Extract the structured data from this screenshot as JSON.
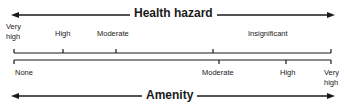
{
  "top_scale": {
    "title": "Health hazard",
    "labels": [
      {
        "line1": "Very",
        "line2": "high"
      },
      {
        "text": "High"
      },
      {
        "text": "Moderate"
      },
      {
        "text": "Insignificant"
      }
    ]
  },
  "bottom_scale": {
    "title": "Amenity",
    "labels": [
      {
        "text": "None"
      },
      {
        "text": "Moderate"
      },
      {
        "text": "High"
      },
      {
        "line1": "Very",
        "line2": "high"
      }
    ]
  },
  "colors": {
    "ink": "#1a1a1a",
    "background": "#ffffff"
  }
}
